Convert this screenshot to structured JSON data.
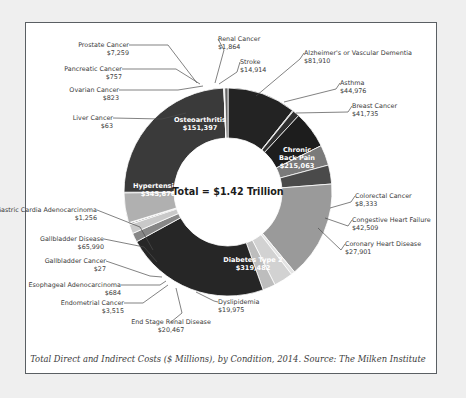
{
  "chart_data": {
    "type": "pie",
    "variant": "donut",
    "title": "",
    "center_label": "Total = $1.42 Trillion",
    "caption": "Total Direct and Indirect Costs ($ Millions), by Condition, 2014. Source: The Milken Institute",
    "unit": "$ Millions",
    "year": 2014,
    "source": "The Milken Institute",
    "total_label": "$1.42 Trillion",
    "total_value": 1420000,
    "legend": "none",
    "grid": false,
    "labels": [
      "Osteoarthritis",
      "Renal Cancer",
      "Stroke",
      "Alzheimer's or Vascular Dementia",
      "Asthma",
      "Breast Cancer",
      "Chronic Back Pain",
      "Colorectal Cancer",
      "Congestive Heart Failure",
      "Coronary Heart Disease",
      "Diabetes Type 2",
      "Dyslipidemia",
      "End Stage Renal Disease",
      "Endometrial Cancer",
      "Esophageal Adenocarcinoma",
      "Gallbladder Cancer",
      "Gallbladder Disease",
      "Gastric Cardia Adenocarcinoma",
      "Hypertension",
      "Liver Cancer",
      "Ovarian Cancer",
      "Pancreatic Cancer",
      "Prostate Cancer"
    ],
    "values": [
      151397,
      1864,
      14914,
      81910,
      44976,
      41735,
      215063,
      8333,
      42509,
      27901,
      319482,
      19975,
      20467,
      3515,
      684,
      27,
      65990,
      1256,
      345676,
      63,
      823,
      757,
      7259
    ],
    "slices": [
      {
        "label": "Osteoarthritis",
        "value": 151397,
        "display": "$151,397",
        "color": "#232323",
        "placement": "inside",
        "text_color": "#ffffff"
      },
      {
        "label": "Renal Cancer",
        "value": 1864,
        "display": "$1,864",
        "color": "#6d6d6d",
        "placement": "callout"
      },
      {
        "label": "Stroke",
        "value": 14914,
        "display": "$14,914",
        "color": "#303030",
        "placement": "callout"
      },
      {
        "label": "Alzheimer's or Vascular Dementia",
        "value": 81910,
        "display": "$81,910",
        "color": "#1d1d1d",
        "placement": "callout"
      },
      {
        "label": "Asthma",
        "value": 44976,
        "display": "$44,976",
        "color": "#7a7a7a",
        "placement": "callout"
      },
      {
        "label": "Breast Cancer",
        "value": 41735,
        "display": "$41,735",
        "color": "#4a4a4a",
        "placement": "callout"
      },
      {
        "label": "Chronic Back Pain",
        "value": 215063,
        "display": "$215,063",
        "color": "#9a9a9a",
        "placement": "inside",
        "text_color": "#ffffff"
      },
      {
        "label": "Colorectal Cancer",
        "value": 8333,
        "display": "$8,333",
        "color": "#e3e3e3",
        "placement": "callout"
      },
      {
        "label": "Congestive Heart Failure",
        "value": 42509,
        "display": "$42,509",
        "color": "#d2d2d2",
        "placement": "callout"
      },
      {
        "label": "Coronary Heart Disease",
        "value": 27901,
        "display": "$27,901",
        "color": "#bdbdbd",
        "placement": "callout"
      },
      {
        "label": "Diabetes Type 2",
        "value": 319482,
        "display": "$319,482",
        "color": "#262626",
        "placement": "inside",
        "text_color": "#ffffff"
      },
      {
        "label": "Dyslipidemia",
        "value": 19975,
        "display": "$19,975",
        "color": "#878787",
        "placement": "callout"
      },
      {
        "label": "End Stage Renal Disease",
        "value": 20467,
        "display": "$20,467",
        "color": "#c9c9c9",
        "placement": "callout"
      },
      {
        "label": "Endometrial Cancer",
        "value": 3515,
        "display": "$3,515",
        "color": "#9e9e9e",
        "placement": "callout"
      },
      {
        "label": "Esophageal Adenocarcinoma",
        "value": 684,
        "display": "$684",
        "color": "#b5b5b5",
        "placement": "callout"
      },
      {
        "label": "Gallbladder Cancer",
        "value": 27,
        "display": "$27",
        "color": "#8d8d8d",
        "placement": "callout"
      },
      {
        "label": "Gallbladder Disease",
        "value": 65990,
        "display": "$65,990",
        "color": "#b0b0b0",
        "placement": "callout"
      },
      {
        "label": "Gastric Cardia Adenocarcinoma",
        "value": 1256,
        "display": "$1,256",
        "color": "#8a8a8a",
        "placement": "callout"
      },
      {
        "label": "Hypertension",
        "value": 345676,
        "display": "$345,676",
        "color": "#3a3a3a",
        "placement": "inside",
        "text_color": "#ffffff"
      },
      {
        "label": "Liver Cancer",
        "value": 63,
        "display": "$63",
        "color": "#747474",
        "placement": "callout"
      },
      {
        "label": "Ovarian Cancer",
        "value": 823,
        "display": "$823",
        "color": "#5e5e5e",
        "placement": "callout"
      },
      {
        "label": "Pancreatic Cancer",
        "value": 757,
        "display": "$757",
        "color": "#9c9c9c",
        "placement": "callout"
      },
      {
        "label": "Prostate Cancer",
        "value": 7259,
        "display": "$7,259",
        "color": "#666666",
        "placement": "callout"
      }
    ],
    "callouts": [
      {
        "label": "Prostate Cancer",
        "display": "$7,259",
        "tx": 129,
        "ty": 47,
        "anchor": "end",
        "elbow": [
          168,
          45
        ],
        "tip": [
          197,
          83
        ]
      },
      {
        "label": "Pancreatic Cancer",
        "display": "$757",
        "tx": 122,
        "ty": 71,
        "anchor": "end",
        "elbow": [
          176,
          69
        ],
        "tip": [
          200,
          84
        ]
      },
      {
        "label": "Ovarian Cancer",
        "display": "$823",
        "tx": 119,
        "ty": 92,
        "anchor": "end",
        "elbow": [
          178,
          90
        ],
        "tip": [
          203,
          86
        ]
      },
      {
        "label": "Liver Cancer",
        "display": "$63",
        "tx": 113,
        "ty": 120,
        "anchor": "end",
        "elbow": [
          162,
          119
        ],
        "tip": [
          186,
          113
        ]
      },
      {
        "label": "Renal Cancer",
        "display": "$1,864",
        "tx": 218,
        "ty": 41,
        "anchor": "start",
        "elbow": [
          224,
          50
        ],
        "tip": [
          215,
          83
        ]
      },
      {
        "label": "Stroke",
        "display": "$14,914",
        "tx": 240,
        "ty": 64,
        "anchor": "start",
        "elbow": [
          237,
          72
        ],
        "tip": [
          219,
          84
        ]
      },
      {
        "label": "Alzheimer's or Vascular Dementia",
        "display": "$81,910",
        "tx": 304,
        "ty": 55,
        "anchor": "start",
        "elbow": [
          300,
          59
        ],
        "tip": [
          256,
          96
        ]
      },
      {
        "label": "Asthma",
        "display": "$44,976",
        "tx": 340,
        "ty": 85,
        "anchor": "start",
        "elbow": [
          336,
          89
        ],
        "tip": [
          284,
          102
        ]
      },
      {
        "label": "Breast Cancer",
        "display": "$41,735",
        "tx": 352,
        "ty": 108,
        "anchor": "start",
        "elbow": [
          348,
          112
        ],
        "tip": [
          296,
          113
        ]
      },
      {
        "label": "Colorectal Cancer",
        "display": "$8,333",
        "tx": 355,
        "ty": 198,
        "anchor": "start",
        "elbow": [
          351,
          202
        ],
        "tip": [
          330,
          208
        ]
      },
      {
        "label": "Congestive Heart Failure",
        "display": "$42,509",
        "tx": 352,
        "ty": 222,
        "anchor": "start",
        "elbow": [
          348,
          226
        ],
        "tip": [
          325,
          218
        ]
      },
      {
        "label": "Coronary Heart Disease",
        "display": "$27,901",
        "tx": 345,
        "ty": 246,
        "anchor": "start",
        "elbow": [
          341,
          250
        ],
        "tip": [
          318,
          228
        ]
      },
      {
        "label": "Dyslipidemia",
        "display": "$19,975",
        "tx": 218,
        "ty": 304,
        "anchor": "start",
        "elbow": [
          214,
          301
        ],
        "tip": [
          196,
          292
        ]
      },
      {
        "label": "End Stage Renal Disease",
        "display": "$20,467",
        "tx": 171,
        "ty": 324,
        "anchor": "middle",
        "elbow": [
          182,
          313
        ],
        "tip": [
          176,
          288
        ]
      },
      {
        "label": "Endometrial Cancer",
        "display": "$3,515",
        "tx": 124,
        "ty": 305,
        "anchor": "end",
        "elbow": [
          143,
          303
        ],
        "tip": [
          168,
          285
        ]
      },
      {
        "label": "Esophageal Adenocarcinoma",
        "display": "$684",
        "tx": 121,
        "ty": 287,
        "anchor": "end",
        "elbow": [
          160,
          285
        ],
        "tip": [
          166,
          281
        ]
      },
      {
        "label": "Gallbladder Cancer",
        "display": "$27",
        "tx": 106,
        "ty": 263,
        "anchor": "end",
        "elbow": [
          150,
          276
        ],
        "tip": [
          162,
          277
        ]
      },
      {
        "label": "Gallbladder Disease",
        "display": "$65,990",
        "tx": 104,
        "ty": 241,
        "anchor": "end",
        "elbow": [
          144,
          247
        ],
        "tip": [
          157,
          262
        ]
      },
      {
        "label": "Gastric Cardia Adenocarcinoma",
        "display": "$1,256",
        "tx": 97,
        "ty": 212,
        "anchor": "end",
        "elbow": [
          140,
          227
        ],
        "tip": [
          153,
          250
        ]
      }
    ],
    "inside_labels": [
      {
        "label": "Osteoarthritis",
        "display": "$151,397",
        "x": 200,
        "y": 122
      },
      {
        "label": "Hypertension",
        "display": "$345,676",
        "x": 158,
        "y": 188
      },
      {
        "label": "Chronic Back Pain",
        "display": "$215,063",
        "x": 297,
        "y": 152,
        "multiline": [
          "Chronic",
          "Back Pain",
          "$215,063"
        ]
      },
      {
        "label": "Diabetes Type 2",
        "display": "$319,482",
        "x": 253,
        "y": 262
      }
    ],
    "geometry": {
      "cx": 228,
      "cy": 192,
      "r_outer": 104,
      "r_inner": 54,
      "start_angle": -90
    }
  },
  "colors": {
    "page_background": "#efefef",
    "frame_background": "#ffffff",
    "frame_border": "#5a5f63",
    "leader_line": "#4c4c4c",
    "callout_text": "#3a3a3a",
    "caption_text": "#3c3c3c",
    "center_text": "#1c1c1c"
  }
}
